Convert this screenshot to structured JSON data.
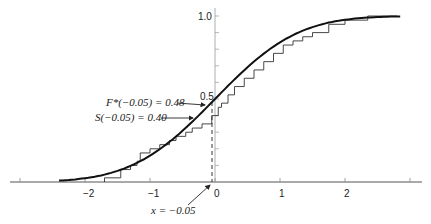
{
  "chart_data": {
    "type": "line",
    "title": "",
    "xlabel": "",
    "ylabel": "",
    "xlim": [
      -3.3,
      3.1
    ],
    "ylim": [
      0,
      1.0
    ],
    "x_ticks": [
      -2,
      -1,
      0,
      1,
      2
    ],
    "x_tick_labels": [
      "-2",
      "-1",
      "0",
      "1",
      "2"
    ],
    "y_tick_labels": [
      "0.5",
      "1.0"
    ],
    "y_minor_tick_step": 0.1,
    "grid": false,
    "legend": null,
    "series": [
      {
        "name": "F*(x) hypothesized normal CDF",
        "style": "smooth-thick",
        "x": [
          -2.4,
          -2.0,
          -1.6,
          -1.2,
          -0.8,
          -0.4,
          -0.05,
          0.0,
          0.4,
          0.8,
          1.2,
          1.6,
          2.0,
          2.4,
          2.8
        ],
        "y": [
          0.008,
          0.023,
          0.055,
          0.115,
          0.212,
          0.345,
          0.48,
          0.5,
          0.655,
          0.788,
          0.885,
          0.945,
          0.977,
          0.992,
          0.997
        ]
      },
      {
        "name": "S(x) empirical step function",
        "style": "step-thin",
        "x": [
          -1.7,
          -1.45,
          -1.3,
          -1.2,
          -1.15,
          -1.0,
          -0.85,
          -0.7,
          -0.6,
          -0.45,
          -0.35,
          -0.2,
          -0.05,
          0.05,
          0.1,
          0.2,
          0.3,
          0.45,
          0.6,
          0.75,
          0.9,
          1.05,
          1.2,
          1.35,
          1.5,
          1.75,
          2.0,
          2.35
        ],
        "y": [
          0.025,
          0.075,
          0.1,
          0.125,
          0.175,
          0.2,
          0.225,
          0.25,
          0.275,
          0.3,
          0.325,
          0.35,
          0.4,
          0.45,
          0.475,
          0.525,
          0.575,
          0.625,
          0.675,
          0.725,
          0.775,
          0.825,
          0.85,
          0.875,
          0.9,
          0.95,
          0.975,
          1.0
        ]
      }
    ],
    "annotations": [
      {
        "text": "F*(−0.05) = 0.48",
        "x": -0.05,
        "y": 0.48,
        "arrow": true
      },
      {
        "text": "S(−0.05) = 0.40",
        "x": -0.05,
        "y": 0.4,
        "arrow": true
      },
      {
        "text": "x = −0.05",
        "x": -0.05,
        "y": 0,
        "arrow": true
      }
    ],
    "reference_line": {
      "type": "vertical-dashed",
      "x": -0.05
    }
  },
  "labels": {
    "y_1_0": "1.0",
    "y_0_5": "0.5",
    "x_m2": "−2",
    "x_m1": "−1",
    "x_0": "0",
    "x_1": "1",
    "x_2": "2",
    "fstar_label": "F*(−0.05) = 0.48",
    "s_label": "S(−0.05) = 0.40",
    "x_label": "x = −0.05"
  }
}
